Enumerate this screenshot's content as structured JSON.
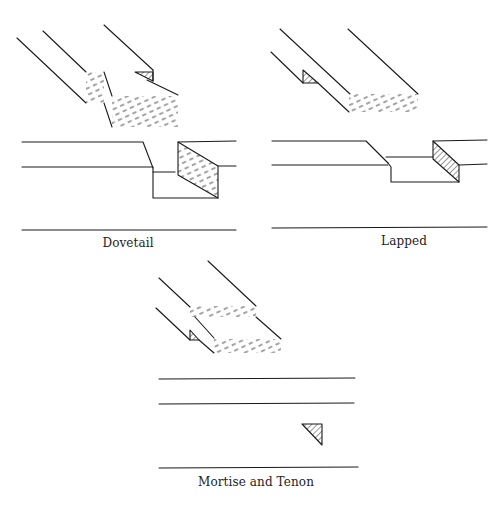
{
  "figure": {
    "colors": {
      "ink": "#1a1a1a",
      "background": "#ffffff"
    },
    "panels": [
      {
        "id": "dovetail",
        "caption": "Dovetail"
      },
      {
        "id": "lapped",
        "caption": "Lapped"
      },
      {
        "id": "mortise-and-tenon",
        "caption": "Mortise and Tenon"
      }
    ]
  }
}
